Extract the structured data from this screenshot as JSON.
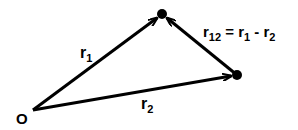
{
  "diagram": {
    "origin_label": "O",
    "points": {
      "origin": {
        "x": 33,
        "y": 110
      },
      "p1": {
        "x": 162,
        "y": 14
      },
      "p2": {
        "x": 237,
        "y": 75
      }
    },
    "labels": {
      "r1": {
        "base": "r",
        "sub": "1"
      },
      "r2": {
        "base": "r",
        "sub": "2"
      },
      "r12": {
        "base": "r",
        "sub": "12",
        "eq": " = ",
        "t1_base": "r",
        "t1_sub": "1",
        "minus": " - ",
        "t2_base": "r",
        "t2_sub": "2"
      }
    },
    "colors": {
      "stroke": "#000000",
      "background": "#ffffff"
    }
  }
}
